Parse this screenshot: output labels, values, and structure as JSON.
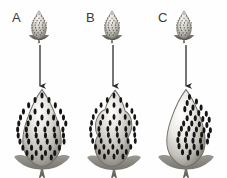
{
  "figure": {
    "title": "",
    "background_color": "#fefefe",
    "width": 227,
    "height": 178,
    "panel_count": 3
  },
  "panels": [
    {
      "id": "A",
      "label": "A",
      "label_x": 12,
      "label_y": 11,
      "small_berry": {
        "name": "small-strawberry-a",
        "x": 27,
        "y": 10,
        "width": 24,
        "height": 30,
        "shape": "conical",
        "seed_count": 34,
        "seed_coverage": "uniform",
        "fill_light": "#f2f0ec",
        "fill_mid": "#c9c6c0",
        "fill_dark": "#8e8a84",
        "calyx_color": "#4a4a46"
      },
      "arrow": {
        "name": "arrow-a",
        "x": 40,
        "y_start": 45,
        "y_end": 88,
        "color": "#2b2b2b",
        "direction": "down"
      },
      "large_berry": {
        "name": "large-strawberry-a",
        "x": 13,
        "y": 88,
        "width": 58,
        "height": 82,
        "shape": "broad-conical-smooth",
        "seed_count": 52,
        "seed_coverage": "uniform-full",
        "fill_light": "#ffffff",
        "fill_mid": "#c8c5bf",
        "fill_dark": "#7e7a74",
        "seed_color": "#1a1a1a",
        "calyx_color": "#6b6b64"
      }
    },
    {
      "id": "B",
      "label": "B",
      "label_x": 86,
      "label_y": 11,
      "small_berry": {
        "name": "small-strawberry-b",
        "x": 100,
        "y": 10,
        "width": 24,
        "height": 30,
        "shape": "conical",
        "seed_count": 32,
        "seed_coverage": "uniform",
        "fill_light": "#f2f0ec",
        "fill_mid": "#c9c6c0",
        "fill_dark": "#8e8a84",
        "calyx_color": "#4a4a46"
      },
      "arrow": {
        "name": "arrow-b",
        "x": 113,
        "y_start": 45,
        "y_end": 88,
        "color": "#2b2b2b",
        "direction": "down"
      },
      "large_berry": {
        "name": "large-strawberry-b",
        "x": 86,
        "y": 88,
        "width": 56,
        "height": 82,
        "shape": "irregular-lobed-misshapen",
        "seed_count": 48,
        "seed_coverage": "uniform-full",
        "fill_light": "#ffffff",
        "fill_mid": "#c8c5bf",
        "fill_dark": "#7e7a74",
        "seed_color": "#1a1a1a",
        "calyx_color": "#6b6b64"
      }
    },
    {
      "id": "C",
      "label": "C",
      "label_x": 158,
      "label_y": 11,
      "small_berry": {
        "name": "small-strawberry-c",
        "x": 172,
        "y": 10,
        "width": 24,
        "height": 30,
        "shape": "conical",
        "seed_count": 33,
        "seed_coverage": "uniform",
        "fill_light": "#f2f0ec",
        "fill_mid": "#c9c6c0",
        "fill_dark": "#8e8a84",
        "calyx_color": "#4a4a46"
      },
      "arrow": {
        "name": "arrow-c",
        "x": 186,
        "y_start": 45,
        "y_end": 88,
        "color": "#2b2b2b",
        "direction": "down"
      },
      "large_berry": {
        "name": "large-strawberry-c",
        "x": 157,
        "y": 88,
        "width": 58,
        "height": 82,
        "shape": "broad-conical-smooth",
        "seed_count": 40,
        "seed_coverage": "right-side-only",
        "fill_light": "#ffffff",
        "fill_mid": "#c8c5bf",
        "fill_dark": "#7e7a74",
        "seed_color": "#1a1a1a",
        "calyx_color": "#6b6b64"
      }
    }
  ],
  "seed_layouts": {
    "uniform_large": [
      [
        0.5,
        0.1
      ],
      [
        0.38,
        0.16
      ],
      [
        0.62,
        0.16
      ],
      [
        0.27,
        0.23
      ],
      [
        0.5,
        0.23
      ],
      [
        0.73,
        0.23
      ],
      [
        0.18,
        0.31
      ],
      [
        0.38,
        0.31
      ],
      [
        0.61,
        0.31
      ],
      [
        0.82,
        0.31
      ],
      [
        0.13,
        0.39
      ],
      [
        0.3,
        0.39
      ],
      [
        0.5,
        0.39
      ],
      [
        0.7,
        0.39
      ],
      [
        0.87,
        0.39
      ],
      [
        0.1,
        0.47
      ],
      [
        0.26,
        0.47
      ],
      [
        0.43,
        0.47
      ],
      [
        0.6,
        0.47
      ],
      [
        0.77,
        0.47
      ],
      [
        0.91,
        0.47
      ],
      [
        0.08,
        0.55
      ],
      [
        0.23,
        0.55
      ],
      [
        0.39,
        0.55
      ],
      [
        0.55,
        0.55
      ],
      [
        0.71,
        0.55
      ],
      [
        0.86,
        0.55
      ],
      [
        0.09,
        0.63
      ],
      [
        0.24,
        0.63
      ],
      [
        0.4,
        0.63
      ],
      [
        0.56,
        0.63
      ],
      [
        0.72,
        0.63
      ],
      [
        0.87,
        0.63
      ],
      [
        0.12,
        0.71
      ],
      [
        0.27,
        0.71
      ],
      [
        0.43,
        0.71
      ],
      [
        0.59,
        0.71
      ],
      [
        0.75,
        0.71
      ],
      [
        0.88,
        0.71
      ],
      [
        0.17,
        0.79
      ],
      [
        0.32,
        0.79
      ],
      [
        0.48,
        0.79
      ],
      [
        0.64,
        0.79
      ],
      [
        0.8,
        0.79
      ],
      [
        0.24,
        0.86
      ],
      [
        0.4,
        0.86
      ],
      [
        0.56,
        0.86
      ],
      [
        0.72,
        0.86
      ],
      [
        0.33,
        0.92
      ],
      [
        0.5,
        0.92
      ],
      [
        0.66,
        0.92
      ]
    ],
    "right_side_large": [
      [
        0.56,
        0.12
      ],
      [
        0.68,
        0.18
      ],
      [
        0.52,
        0.2
      ],
      [
        0.62,
        0.26
      ],
      [
        0.76,
        0.26
      ],
      [
        0.48,
        0.28
      ],
      [
        0.58,
        0.33
      ],
      [
        0.72,
        0.33
      ],
      [
        0.85,
        0.34
      ],
      [
        0.52,
        0.4
      ],
      [
        0.66,
        0.4
      ],
      [
        0.79,
        0.41
      ],
      [
        0.9,
        0.42
      ],
      [
        0.46,
        0.47
      ],
      [
        0.6,
        0.47
      ],
      [
        0.73,
        0.48
      ],
      [
        0.86,
        0.49
      ],
      [
        0.42,
        0.54
      ],
      [
        0.55,
        0.54
      ],
      [
        0.68,
        0.55
      ],
      [
        0.81,
        0.56
      ],
      [
        0.92,
        0.56
      ],
      [
        0.38,
        0.61
      ],
      [
        0.51,
        0.61
      ],
      [
        0.64,
        0.62
      ],
      [
        0.77,
        0.62
      ],
      [
        0.89,
        0.63
      ],
      [
        0.36,
        0.69
      ],
      [
        0.49,
        0.69
      ],
      [
        0.62,
        0.7
      ],
      [
        0.75,
        0.7
      ],
      [
        0.87,
        0.71
      ],
      [
        0.38,
        0.77
      ],
      [
        0.51,
        0.77
      ],
      [
        0.64,
        0.78
      ],
      [
        0.77,
        0.78
      ],
      [
        0.44,
        0.85
      ],
      [
        0.57,
        0.85
      ],
      [
        0.7,
        0.86
      ],
      [
        0.54,
        0.92
      ]
    ],
    "uniform_small": [
      [
        0.5,
        0.14
      ],
      [
        0.4,
        0.21
      ],
      [
        0.6,
        0.21
      ],
      [
        0.32,
        0.29
      ],
      [
        0.5,
        0.29
      ],
      [
        0.68,
        0.29
      ],
      [
        0.26,
        0.37
      ],
      [
        0.42,
        0.37
      ],
      [
        0.58,
        0.37
      ],
      [
        0.74,
        0.37
      ],
      [
        0.22,
        0.45
      ],
      [
        0.37,
        0.45
      ],
      [
        0.52,
        0.45
      ],
      [
        0.67,
        0.45
      ],
      [
        0.8,
        0.45
      ],
      [
        0.2,
        0.53
      ],
      [
        0.34,
        0.53
      ],
      [
        0.49,
        0.53
      ],
      [
        0.64,
        0.53
      ],
      [
        0.79,
        0.53
      ],
      [
        0.21,
        0.62
      ],
      [
        0.36,
        0.62
      ],
      [
        0.51,
        0.62
      ],
      [
        0.66,
        0.62
      ],
      [
        0.8,
        0.62
      ],
      [
        0.25,
        0.71
      ],
      [
        0.4,
        0.71
      ],
      [
        0.55,
        0.71
      ],
      [
        0.7,
        0.71
      ],
      [
        0.31,
        0.8
      ],
      [
        0.46,
        0.8
      ],
      [
        0.61,
        0.8
      ],
      [
        0.4,
        0.88
      ],
      [
        0.55,
        0.88
      ]
    ]
  },
  "shapes": {
    "berry_broad": "M50,2 C58,10 68,24 76,42 C84,60 86,76 78,88 C70,99 58,104 50,104 C42,104 30,99 22,88 C14,76 16,60 24,42 C32,24 42,10 50,2 Z",
    "berry_irregular": "M52,3 C60,10 66,20 70,31 C76,33 82,40 82,50 C82,58 77,63 74,68 C79,74 80,84 73,92 C65,101 54,105 46,105 C36,105 25,100 19,90 C13,80 16,70 21,64 C16,58 15,48 20,40 C24,33 30,30 34,29 C38,18 45,9 52,3 Z",
    "berry_small": "M50,3 C58,12 70,30 77,50 C83,68 80,84 68,93 C60,99 54,100 50,100 C46,100 40,99 32,93 C20,84 17,68 23,50 C30,30 42,12 50,3 Z",
    "calyx_large": "M50,0 C44,-2 36,-6 26,-9 C16,-12 6,-12 2,-9 C6,-4 16,2 26,5 C34,7 42,8 48,8 L44,22 L50,16 L56,22 L52,8 C58,8 66,7 74,5 C84,2 94,-4 98,-9 C94,-12 84,-12 74,-9 C64,-6 56,-2 50,0 Z",
    "calyx_small": "M50,0 C45,-3 38,-8 28,-11 C20,-13 12,-13 8,-11 C12,-6 20,-1 28,2 C36,5 44,6 48,6 L45,18 L50,13 L55,18 L52,6 C56,6 64,5 72,2 C80,-1 88,-6 92,-11 C88,-13 80,-13 72,-11 C62,-8 55,-3 50,0 Z"
  }
}
